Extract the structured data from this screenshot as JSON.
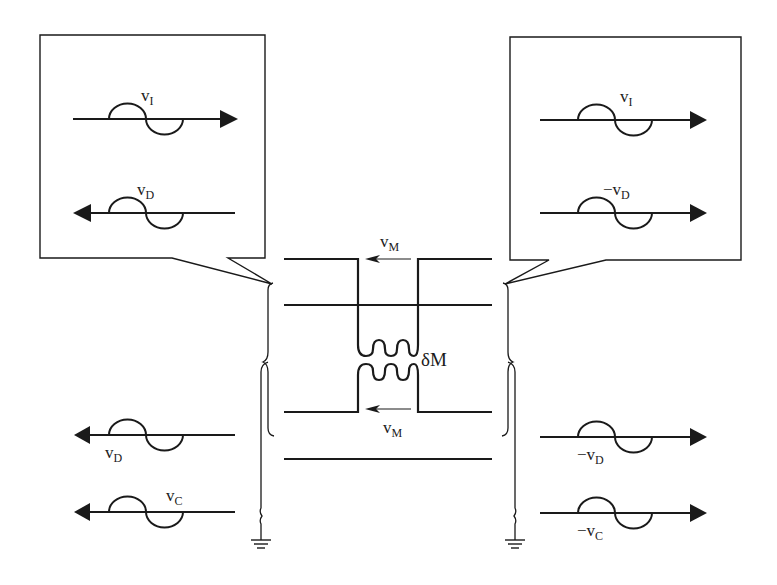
{
  "diagram": {
    "type": "crosstalk-coupled-transmission-lines",
    "left_callout": {
      "waves": [
        {
          "label_main": "v",
          "label_sub": "I",
          "direction": "right"
        },
        {
          "label_main": "v",
          "label_sub": "D",
          "direction": "left"
        }
      ]
    },
    "right_callout": {
      "waves": [
        {
          "label_main": "v",
          "label_sub": "I",
          "direction": "right"
        },
        {
          "label_main": "−v",
          "label_sub": "D",
          "direction": "right"
        }
      ]
    },
    "center": {
      "top_current": {
        "label_main": "v",
        "label_sub": "M"
      },
      "bottom_current": {
        "label_main": "v",
        "label_sub": "M"
      },
      "mutual_inductance": {
        "label": "δM"
      }
    },
    "bottom_left": {
      "waves": [
        {
          "label_main": "v",
          "label_sub": "D",
          "direction": "left"
        },
        {
          "label_main": "v",
          "label_sub": "C",
          "direction": "left"
        }
      ]
    },
    "bottom_right": {
      "waves": [
        {
          "label_main": "−v",
          "label_sub": "D",
          "direction": "right"
        },
        {
          "label_main": "−v",
          "label_sub": "C",
          "direction": "right"
        }
      ]
    },
    "colors": {
      "stroke": "#1a1a1a",
      "background": "#ffffff"
    }
  }
}
